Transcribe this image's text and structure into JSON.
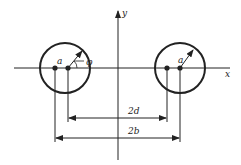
{
  "diagram": {
    "type": "two-wire line cross-section with coordinate axes",
    "axes": {
      "x_label": "x",
      "y_label": "y"
    },
    "left_conductor": {
      "radius_label": "a",
      "angle_label": "φ"
    },
    "right_conductor": {
      "radius_label": "a"
    },
    "dimensions": {
      "inner_label": "2d",
      "outer_label": "2b"
    },
    "colors": {
      "stroke": "#222222",
      "background": "#ffffff"
    }
  }
}
